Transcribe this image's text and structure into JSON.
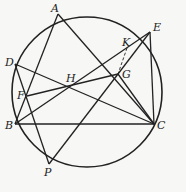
{
  "diagram": {
    "type": "geometry-circle",
    "circle": {
      "cx": 87,
      "cy": 92,
      "r": 75
    },
    "colors": {
      "stroke": "#222222",
      "background": "#f7f7f5"
    },
    "points": {
      "A": {
        "x": 58,
        "y": 14,
        "label": "A",
        "lx": 51,
        "ly": 12
      },
      "E": {
        "x": 150,
        "y": 32,
        "label": "E",
        "lx": 153,
        "ly": 31
      },
      "D": {
        "x": 15,
        "y": 64,
        "label": "D",
        "lx": 5,
        "ly": 66
      },
      "B": {
        "x": 15,
        "y": 124,
        "label": "B",
        "lx": 5,
        "ly": 129
      },
      "C": {
        "x": 154,
        "y": 124,
        "label": "C",
        "lx": 157,
        "ly": 129
      },
      "P": {
        "x": 49,
        "y": 164,
        "label": "P",
        "lx": 44,
        "ly": 176
      },
      "H": {
        "x": 72,
        "y": 84,
        "label": "H",
        "lx": 66,
        "ly": 82
      },
      "G": {
        "x": 118,
        "y": 74,
        "label": "G",
        "lx": 122,
        "ly": 78
      },
      "F": {
        "x": 27,
        "y": 96,
        "label": "F",
        "lx": 17,
        "ly": 99
      },
      "K": {
        "x": 127,
        "y": 48,
        "label": "K",
        "lx": 122,
        "ly": 46
      }
    },
    "segments": [
      [
        "A",
        "B"
      ],
      [
        "A",
        "C"
      ],
      [
        "D",
        "C"
      ],
      [
        "D",
        "P"
      ],
      [
        "B",
        "E"
      ],
      [
        "B",
        "C"
      ],
      [
        "F",
        "G"
      ],
      [
        "E",
        "C"
      ],
      [
        "P",
        "G"
      ],
      [
        "G",
        "C"
      ],
      [
        "E",
        "G"
      ]
    ],
    "dashed_segments": [
      [
        "K",
        "G"
      ]
    ]
  }
}
